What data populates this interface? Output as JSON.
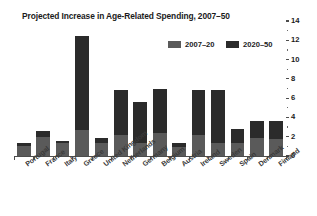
{
  "chart_data": {
    "type": "bar",
    "title": "Projected Increase in Age-Related Spending, 2007–50",
    "xlabel": "",
    "ylabel": "",
    "ylim": [
      0,
      14
    ],
    "yticks": [
      0,
      2,
      4,
      6,
      8,
      10,
      12,
      14
    ],
    "ytick_labels": [
      "0",
      "2",
      "4",
      "6",
      "8",
      "10",
      "12",
      "14"
    ],
    "minor_yticks": [
      1,
      3,
      5,
      7,
      9,
      11,
      13
    ],
    "grid": false,
    "stacked": true,
    "legend_position": "top-right",
    "categories": [
      "Portugal",
      "France",
      "Italy",
      "Greece",
      "United Kingdom",
      "Netherlands",
      "Germany",
      "Belgium",
      "Austria",
      "Ireland",
      "Sweden",
      "Spain",
      "Denmark",
      "Finland"
    ],
    "series": [
      {
        "name": "2007–20",
        "color": "#5a5a5a",
        "values": [
          1.0,
          2.0,
          1.3,
          2.7,
          1.3,
          2.2,
          1.3,
          2.4,
          0.9,
          2.2,
          1.4,
          1.4,
          1.9,
          1.8
        ]
      },
      {
        "name": "2020–50",
        "color": "#2b2b2b",
        "values": [
          0.4,
          0.6,
          0.3,
          9.7,
          0.6,
          4.6,
          4.3,
          4.5,
          0.4,
          4.6,
          5.4,
          1.4,
          1.7,
          1.8
        ]
      }
    ],
    "totals": [
      1.4,
      2.6,
      1.6,
      12.4,
      1.9,
      6.8,
      5.6,
      6.9,
      1.3,
      6.8,
      6.8,
      2.8,
      3.6,
      3.6
    ]
  },
  "legend": {
    "items": [
      {
        "label": "2007–20",
        "key": "early"
      },
      {
        "label": "2020–50",
        "key": "late"
      }
    ]
  },
  "colors": {
    "early": "#5a5a5a",
    "late": "#2b2b2b",
    "axis": "#4d4d4d",
    "text": "#1b1b1b",
    "label": "#3a3a3a",
    "background": "#ffffff"
  }
}
